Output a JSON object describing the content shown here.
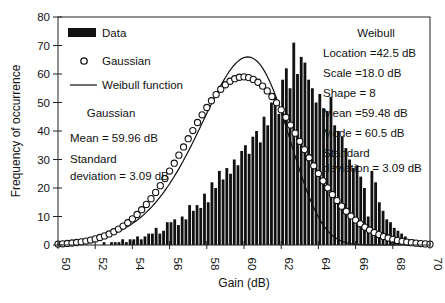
{
  "chart_data": {
    "type": "bar",
    "title": "",
    "xlabel": "Gain (dB)",
    "ylabel": "Frequency of occurrence",
    "xlim": [
      50,
      70
    ],
    "ylim": [
      0,
      80
    ],
    "xticks": [
      "50",
      "52",
      "54",
      "56",
      "58",
      "60",
      "62",
      "64",
      "66",
      "68",
      "70"
    ],
    "yticks": [
      "0",
      "10",
      "20",
      "30",
      "40",
      "50",
      "60",
      "70",
      "80"
    ],
    "grid": false,
    "legend": {
      "position": "upper left",
      "entries": [
        "Data",
        "Gaussian",
        "Weibull function"
      ]
    },
    "series": [
      {
        "name": "Data",
        "kind": "histogram",
        "bin_start": 50.0,
        "bin_width": 0.2,
        "values": [
          0,
          0,
          0,
          0,
          0,
          0,
          0,
          0,
          0,
          0,
          0,
          0,
          1,
          0,
          1,
          1,
          1,
          2,
          1,
          2,
          2,
          3,
          2,
          3,
          4,
          4,
          6,
          4,
          5,
          8,
          8,
          9,
          7,
          10,
          9,
          14,
          12,
          14,
          13,
          18,
          15,
          22,
          20,
          26,
          23,
          27,
          25,
          30,
          28,
          33,
          35,
          32,
          38,
          40,
          36,
          45,
          42,
          50,
          52,
          46,
          58,
          62,
          55,
          71,
          60,
          66,
          64,
          58,
          55,
          50,
          53,
          48,
          47,
          52,
          42,
          40,
          38,
          34,
          30,
          27,
          28,
          24,
          20,
          10,
          26,
          22,
          15,
          12,
          9,
          8,
          6,
          5,
          4,
          3,
          2,
          2,
          1,
          1,
          0,
          0
        ]
      },
      {
        "name": "Gaussian",
        "kind": "markers",
        "mean": 59.96,
        "std": 3.09,
        "peak": 59
      },
      {
        "name": "Weibull function",
        "kind": "line",
        "location": 42.5,
        "scale": 18.0,
        "shape": 8,
        "peak": 66
      }
    ],
    "annotations": {
      "gaussian": {
        "title": "Gaussian",
        "lines": [
          "Mean = 59.96 dB",
          "Standard",
          "deviation = 3.09 dB"
        ]
      },
      "weibull": {
        "title": "Weibull",
        "lines": [
          "Location =42.5 dB",
          "Scale =18.0 dB",
          "Shape = 8",
          "Mean =59.48 dB",
          "Mode = 60.5 dB",
          "Standard",
          "deviation = 3.09 dB"
        ]
      }
    }
  }
}
